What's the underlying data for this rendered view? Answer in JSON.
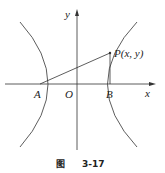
{
  "figure": {
    "caption_prefix": "图",
    "caption_number": "3-17"
  },
  "axes": {
    "x_label": "x",
    "y_label": "y",
    "origin_label": "O"
  },
  "points": {
    "A": "A",
    "B": "B",
    "P": "P(x, y)"
  },
  "colors": {
    "stroke": "#333333",
    "background": "#ffffff"
  }
}
